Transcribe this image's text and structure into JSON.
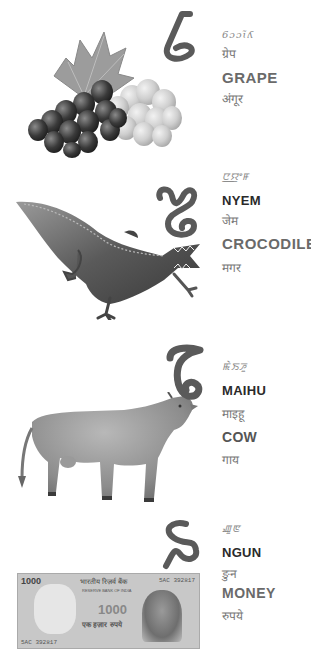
{
  "page": {
    "background": "#ffffff",
    "glyph_color": "#5a5a5a"
  },
  "entries": [
    {
      "letter_name": "gok-letter",
      "image": "grape-bunch-image",
      "meitei_mayek": "ꯒ꯭ꯔꯦꯞ",
      "meitei_mayek_display": "6ɔɔɩ̃ʎ",
      "hindi_transliteration": "ग्रेप",
      "english": "GRAPE",
      "hindi": "अंगूर"
    },
    {
      "letter_name": "nyem-letter",
      "image": "crocodile-image",
      "meitei_mayek_display": "ꯅ꯭ꯌꯦꯝ",
      "meitei": "NYEM",
      "hindi_transliteration": "जेम",
      "english": "CROCODILE",
      "hindi": "मगर"
    },
    {
      "letter_name": "mai-letter",
      "image": "cow-image",
      "meitei_mayek_display": "ꯃꯥꯏꯍꯨ",
      "meitei": "MAIHU",
      "hindi_transliteration": "माइहू",
      "english": "COW",
      "hindi": "गाय"
    },
    {
      "letter_name": "ngou-letter",
      "image": "rupee-banknote-image",
      "meitei_mayek_display": "ꯉꯨꯟ",
      "meitei": "NGUN",
      "hindi_transliteration": "ङुन",
      "english": "MONEY",
      "hindi": "रुपये"
    }
  ],
  "banknote": {
    "denomination": "1000",
    "serial": "5AC 392817",
    "bank_text": "भारतीय रिज़र्व बैंक",
    "bank_text_en": "RESERVE BANK OF INDIA",
    "amount_words_hindi": "एक हज़ार रुपये"
  }
}
